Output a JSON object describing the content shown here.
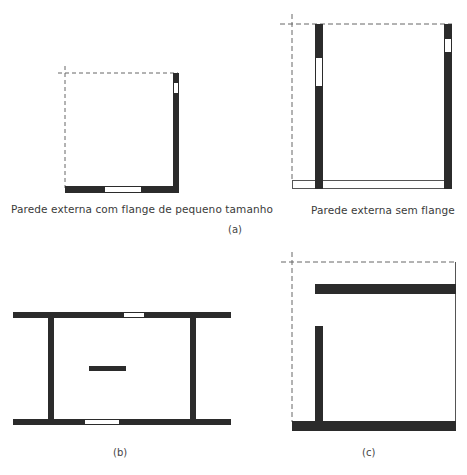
{
  "figure": {
    "panels": [
      {
        "id": "a-left",
        "caption": "Parede externa com flange de pequeno tamanho"
      },
      {
        "id": "a-right",
        "caption": "Parede externa sem flange"
      },
      {
        "id": "b",
        "label": "(b)"
      },
      {
        "id": "c",
        "label": "(c)"
      }
    ],
    "group_label_a": "(a)",
    "colors": {
      "wall": "#2b2b2b",
      "outline": "#555555",
      "dash": "#666666",
      "background": "#ffffff"
    }
  }
}
